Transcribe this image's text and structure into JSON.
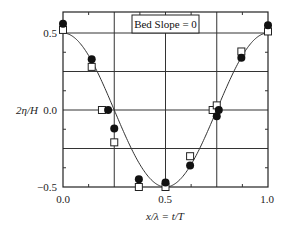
{
  "chart_data": {
    "type": "scatter",
    "title": "",
    "annotation": "Bed Slope = 0",
    "xlabel": "x/λ = t/T",
    "ylabel": "2η/H",
    "xlim": [
      0.0,
      1.0
    ],
    "ylim": [
      -0.5,
      0.5
    ],
    "xticks": [
      "0.0",
      "0.5",
      "1.0"
    ],
    "yticks": [
      "0.5",
      "0.0",
      "−0.5"
    ],
    "grid": true,
    "legend_position": "top-center",
    "series": [
      {
        "name": "theory (cosine)",
        "kind": "line",
        "function": "0.5*cos(2*pi*x)"
      },
      {
        "name": "measured (filled circles)",
        "kind": "marker-circle-filled",
        "x": [
          0.0,
          0.14,
          0.22,
          0.25,
          0.37,
          0.5,
          0.62,
          0.75,
          0.76,
          0.87,
          1.0
        ],
        "y": [
          0.56,
          0.33,
          0.0,
          -0.12,
          -0.45,
          -0.47,
          -0.36,
          -0.04,
          0.0,
          0.34,
          0.55
        ]
      },
      {
        "name": "measured (open squares)",
        "kind": "marker-square-open",
        "x": [
          0.0,
          0.14,
          0.19,
          0.25,
          0.37,
          0.5,
          0.62,
          0.73,
          0.75,
          0.87,
          1.0
        ],
        "y": [
          0.52,
          0.28,
          0.0,
          -0.21,
          -0.5,
          -0.5,
          -0.3,
          0.0,
          0.03,
          0.38,
          0.51
        ]
      }
    ]
  }
}
